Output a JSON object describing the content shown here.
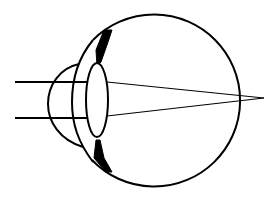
{
  "diagram": {
    "colors": {
      "stroke": "#000000",
      "background": "#ffffff"
    },
    "eyeball": {
      "cx": 157,
      "cy": 101,
      "r": 86
    },
    "lens": {
      "cx": 97,
      "cy": 100,
      "rx": 11,
      "ry": 37
    },
    "focal_point": {
      "x": 264,
      "y": 98
    },
    "rays": [
      {
        "y": 82,
        "x_start": 15,
        "x_lens": 92,
        "x_exit": 107
      },
      {
        "y": 118,
        "x_start": 15,
        "x_lens": 92,
        "x_exit": 107
      }
    ]
  }
}
